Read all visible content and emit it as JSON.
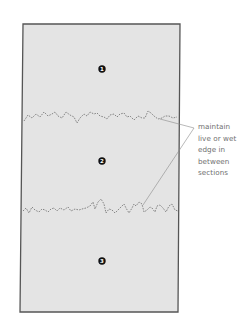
{
  "diagram": {
    "colors": {
      "panel_fill": "#e4e4e4",
      "panel_border": "#555555",
      "wavy_line": "#7a7a7a",
      "leader_line": "#8a8a8a",
      "marker_fill": "#111111",
      "marker_text": "#ffffff",
      "annotation_text": "#6f6f6f"
    },
    "sections": [
      {
        "number": "1",
        "label": "section-1"
      },
      {
        "number": "2",
        "label": "section-2"
      },
      {
        "number": "3",
        "label": "section-3"
      }
    ],
    "annotation": {
      "lines": [
        "maintain",
        "live or wet",
        "edge in",
        "between",
        "sections"
      ]
    }
  }
}
